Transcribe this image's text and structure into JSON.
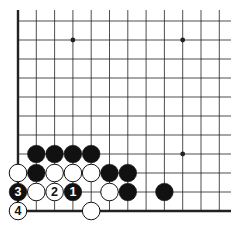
{
  "diagram": {
    "type": "go-board-fragment",
    "grid": {
      "columns_x": [
        18,
        36.3,
        54.6,
        72.9,
        91.2,
        109.5,
        127.8,
        146.1,
        164.4,
        182.7,
        201,
        219.3
      ],
      "rows_y": [
        21,
        40,
        59,
        78,
        97,
        116,
        135,
        154,
        173,
        192,
        211
      ],
      "top_y": 10,
      "right_x": 231,
      "left_edge_x": 18,
      "bottom_edge_y": 211
    },
    "colors": {
      "line": "#222222",
      "black_stone": "#111111",
      "white_stone": "#ffffff",
      "edge": "#111111"
    },
    "star_points": [
      {
        "col": 3,
        "row": 1
      },
      {
        "col": 9,
        "row": 1
      },
      {
        "col": 9,
        "row": 7
      }
    ],
    "stones": [
      {
        "col": 1,
        "row": 7,
        "color": "black",
        "label": ""
      },
      {
        "col": 2,
        "row": 7,
        "color": "black",
        "label": ""
      },
      {
        "col": 3,
        "row": 7,
        "color": "black",
        "label": ""
      },
      {
        "col": 4,
        "row": 7,
        "color": "black",
        "label": ""
      },
      {
        "col": 0,
        "row": 8,
        "color": "white",
        "label": ""
      },
      {
        "col": 1,
        "row": 8,
        "color": "black",
        "label": ""
      },
      {
        "col": 2,
        "row": 8,
        "color": "white",
        "label": ""
      },
      {
        "col": 3,
        "row": 8,
        "color": "white",
        "label": ""
      },
      {
        "col": 4,
        "row": 8,
        "color": "white",
        "label": ""
      },
      {
        "col": 5,
        "row": 8,
        "color": "black",
        "label": ""
      },
      {
        "col": 6,
        "row": 8,
        "color": "black",
        "label": ""
      },
      {
        "col": 0,
        "row": 9,
        "color": "black",
        "label": "3"
      },
      {
        "col": 1,
        "row": 9,
        "color": "white",
        "label": ""
      },
      {
        "col": 2,
        "row": 9,
        "color": "white",
        "label": "2"
      },
      {
        "col": 3,
        "row": 9,
        "color": "black",
        "label": "1"
      },
      {
        "col": 5,
        "row": 9,
        "color": "white",
        "label": ""
      },
      {
        "col": 6,
        "row": 9,
        "color": "black",
        "label": ""
      },
      {
        "col": 8,
        "row": 9,
        "color": "black",
        "label": ""
      },
      {
        "col": 0,
        "row": 10,
        "color": "white",
        "label": "4"
      },
      {
        "col": 4,
        "row": 10,
        "color": "white",
        "label": ""
      }
    ]
  }
}
